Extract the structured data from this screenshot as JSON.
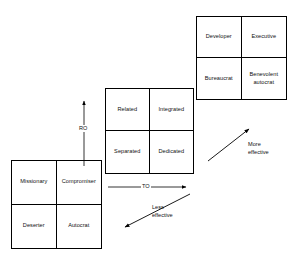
{
  "diagram": {
    "line_color": "#000000",
    "text_color": "#111111",
    "background": "#ffffff"
  },
  "grids": {
    "basic": {
      "name": "less effective styles grid",
      "cells": [
        {
          "label": "Missionary",
          "position": "top-left"
        },
        {
          "label": "Compromiser",
          "position": "top-right"
        },
        {
          "label": "Deserter",
          "position": "bottom-left"
        },
        {
          "label": "Autocrat",
          "position": "bottom-right"
        }
      ]
    },
    "core": {
      "name": "basic styles grid",
      "cells": [
        {
          "label": "Related",
          "position": "top-left"
        },
        {
          "label": "Integrated",
          "position": "top-right"
        },
        {
          "label": "Separated",
          "position": "bottom-left"
        },
        {
          "label": "Dedicated",
          "position": "bottom-right"
        }
      ]
    },
    "effective": {
      "name": "more effective styles grid",
      "cells": [
        {
          "label": "Developer",
          "position": "top-left"
        },
        {
          "label": "Executive",
          "position": "top-right"
        },
        {
          "label": "Bureaucrat",
          "position": "bottom-left"
        },
        {
          "label": "Benevolent\nautocrat",
          "position": "bottom-right",
          "line1": "Benevolent",
          "line2": "autocrat"
        }
      ]
    }
  },
  "axes": {
    "vertical": {
      "label": "RO",
      "direction": "up"
    },
    "horizontal": {
      "label": "TO",
      "direction": "right"
    }
  },
  "annotations": {
    "more_effective": {
      "line1": "More",
      "line2": "effective",
      "direction": "up-right"
    },
    "less_effective": {
      "line1": "Less",
      "line2": "effective",
      "direction": "down-left"
    }
  }
}
